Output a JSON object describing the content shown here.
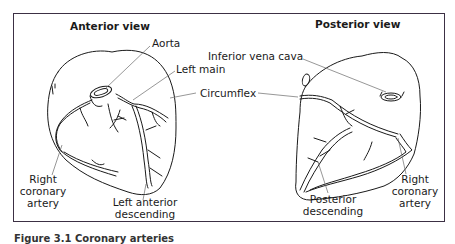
{
  "figure": {
    "anterior": {
      "title": "Anterior view",
      "labels": {
        "aorta": "Aorta",
        "left_main": "Left main",
        "circumflex": "Circumflex",
        "right_coronary_1": "Right",
        "right_coronary_2": "coronary",
        "right_coronary_3": "artery",
        "lad_1": "Left anterior",
        "lad_2": "descending"
      }
    },
    "posterior": {
      "title": "Posterior view",
      "labels": {
        "ivc": "Inferior vena cava",
        "posterior_desc_1": "Posterior",
        "posterior_desc_2": "descending",
        "right_coronary_1": "Right",
        "right_coronary_2": "coronary",
        "right_coronary_3": "artery"
      }
    },
    "caption": "Figure 3.1   Coronary arteries"
  },
  "colors": {
    "frame": "#3c3044",
    "ink": "#1a1a1a",
    "leader": "#6a6a6a"
  }
}
